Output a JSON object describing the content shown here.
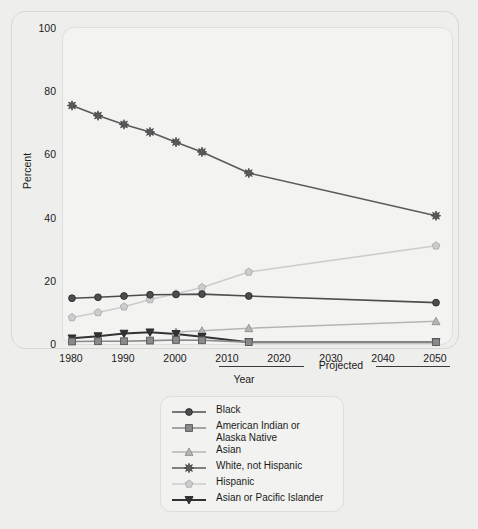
{
  "axes": {
    "ylabel": "Percent",
    "xlabel": "Year",
    "projected_label": "Projected",
    "yticks": [
      "0",
      "20",
      "40",
      "60",
      "80",
      "100"
    ],
    "xticks": [
      "1980",
      "1990",
      "2000",
      "2010",
      "2020",
      "2030",
      "2040",
      "2050"
    ]
  },
  "legend": {
    "items": [
      {
        "label": "Black",
        "marker": "circle-icon",
        "color": "#4d4d4d"
      },
      {
        "label": "American Indian or\nAlaska Native",
        "marker": "square-icon",
        "color": "#8a8a8a"
      },
      {
        "label": "Asian",
        "marker": "triangle-up-icon",
        "color": "#b5b5b5"
      },
      {
        "label": "White, not Hispanic",
        "marker": "star-icon",
        "color": "#5a5a5a"
      },
      {
        "label": "Hispanic",
        "marker": "pentagon-icon",
        "color": "#cccccc"
      },
      {
        "label": "Asian or Pacific Islander",
        "marker": "triangle-down-icon",
        "color": "#333333"
      }
    ]
  },
  "chart_data": {
    "type": "line",
    "title": "",
    "xlabel": "Year",
    "ylabel": "Percent",
    "xlim": [
      1978,
      2052
    ],
    "ylim": [
      0,
      100
    ],
    "grid": false,
    "legend_position": "below-plot",
    "annotations": [
      {
        "text": "Year",
        "range": [
          2010,
          2028
        ]
      },
      {
        "text": "Projected",
        "range": [
          2035,
          2050
        ]
      }
    ],
    "series": [
      {
        "name": "White, not Hispanic",
        "marker": "star",
        "color": "#5a5a5a",
        "x": [
          1980,
          1985,
          1990,
          1995,
          2000,
          2005,
          2014,
          2050
        ],
        "values": [
          75.8,
          72.6,
          69.8,
          67.4,
          64.2,
          61.1,
          54.4,
          40.9
        ]
      },
      {
        "name": "Hispanic",
        "marker": "pentagon",
        "color": "#cccccc",
        "x": [
          1980,
          1985,
          1990,
          1995,
          2000,
          2005,
          2014,
          2050
        ],
        "values": [
          8.7,
          10.3,
          12.1,
          14.4,
          16.2,
          18.2,
          23.1,
          31.4
        ]
      },
      {
        "name": "Black",
        "marker": "circle",
        "color": "#4d4d4d",
        "x": [
          1980,
          1985,
          1990,
          1995,
          2000,
          2005,
          2014,
          2050
        ],
        "values": [
          14.8,
          15.1,
          15.5,
          15.9,
          16.0,
          16.1,
          15.5,
          13.4
        ]
      },
      {
        "name": "Asian",
        "marker": "triangle-up",
        "color": "#b5b5b5",
        "x": [
          2000,
          2005,
          2014,
          2050
        ],
        "values": [
          4.1,
          4.5,
          5.3,
          7.5
        ]
      },
      {
        "name": "Asian or Pacific Islander",
        "marker": "triangle-down",
        "color": "#333333",
        "x": [
          1980,
          1985,
          1990,
          1995,
          2000,
          2005,
          2014,
          2050
        ],
        "values": [
          2.1,
          2.8,
          3.6,
          4.0,
          3.5,
          2.6,
          0.9,
          0.9
        ]
      },
      {
        "name": "American Indian or Alaska Native",
        "marker": "square",
        "color": "#8a8a8a",
        "x": [
          1980,
          1985,
          1990,
          1995,
          2000,
          2005,
          2014,
          2050
        ],
        "values": [
          1.1,
          1.2,
          1.2,
          1.4,
          1.6,
          1.5,
          0.9,
          0.9
        ]
      }
    ]
  }
}
